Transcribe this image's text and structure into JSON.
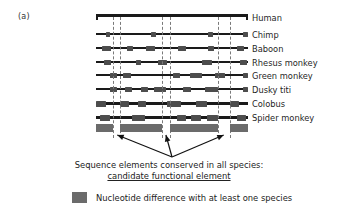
{
  "figure": {
    "panel_label": "(a)",
    "caption_line1": "Sequence elements conserved in all species:",
    "caption_line2": "candidate functional element",
    "colors": {
      "backbone": "#1a1a1a",
      "difference_mark": "#4d4d4d",
      "summary_bar": "#6b6b6b",
      "dashed_guide": "#7a7a7a",
      "background": "#ffffff"
    }
  },
  "legend": {
    "swatch_name": "nucleotide-difference-swatch",
    "text": "Nucleotide difference with at least one species"
  },
  "conserved_regions": [
    {
      "start_pct": 11.2,
      "end_pct": 15.8
    },
    {
      "start_pct": 43.4,
      "end_pct": 48.7
    },
    {
      "start_pct": 80.3,
      "end_pct": 88.2
    }
  ],
  "guide_lines_pct": [
    11.2,
    15.8,
    43.4,
    48.7,
    80.3,
    88.2
  ],
  "summary_segments_pct": [
    {
      "start": 0.0,
      "end": 11.2
    },
    {
      "start": 15.8,
      "end": 43.4
    },
    {
      "start": 48.7,
      "end": 80.3
    },
    {
      "start": 88.2,
      "end": 100.0
    }
  ],
  "arrows": [
    {
      "from_pct": 50.0,
      "to_pct": 14.0,
      "name": "arrow-to-region-1"
    },
    {
      "from_pct": 50.0,
      "to_pct": 46.0,
      "name": "arrow-to-region-2"
    },
    {
      "from_pct": 50.0,
      "to_pct": 84.0,
      "name": "arrow-to-region-3"
    }
  ],
  "tracks": [
    {
      "species": "Human",
      "y": 0,
      "backbone_height": 3,
      "is_reference": true,
      "marks": []
    },
    {
      "species": "Chimp",
      "y": 16,
      "backbone_height": 2,
      "is_reference": false,
      "marks": [
        {
          "x_pct": 6.5,
          "w_pct": 3.0
        },
        {
          "x_pct": 36.5,
          "w_pct": 3.0
        },
        {
          "x_pct": 74.0,
          "w_pct": 3.0
        },
        {
          "x_pct": 96.5,
          "w_pct": 3.5
        }
      ]
    },
    {
      "species": "Baboon",
      "y": 30,
      "backbone_height": 2,
      "is_reference": false,
      "marks": [
        {
          "x_pct": 4.0,
          "w_pct": 6.0
        },
        {
          "x_pct": 20.5,
          "w_pct": 4.0
        },
        {
          "x_pct": 33.0,
          "w_pct": 6.0
        },
        {
          "x_pct": 54.0,
          "w_pct": 5.0
        },
        {
          "x_pct": 73.5,
          "w_pct": 4.0
        },
        {
          "x_pct": 92.5,
          "w_pct": 5.0
        }
      ]
    },
    {
      "species": "Rhesus monkey",
      "y": 44,
      "backbone_height": 2,
      "is_reference": false,
      "marks": [
        {
          "x_pct": 5.5,
          "w_pct": 4.5
        },
        {
          "x_pct": 26.0,
          "w_pct": 3.5
        },
        {
          "x_pct": 40.5,
          "w_pct": 6.0
        },
        {
          "x_pct": 70.0,
          "w_pct": 6.5
        },
        {
          "x_pct": 95.0,
          "w_pct": 4.5
        }
      ]
    },
    {
      "species": "Green monkey",
      "y": 57,
      "backbone_height": 2,
      "is_reference": false,
      "marks": [
        {
          "x_pct": 9.0,
          "w_pct": 5.0
        },
        {
          "x_pct": 17.5,
          "w_pct": 5.5
        },
        {
          "x_pct": 50.5,
          "w_pct": 5.0
        },
        {
          "x_pct": 62.0,
          "w_pct": 7.5
        },
        {
          "x_pct": 78.5,
          "w_pct": 6.5
        },
        {
          "x_pct": 97.0,
          "w_pct": 3.0
        }
      ]
    },
    {
      "species": "Dusky titi",
      "y": 71,
      "backbone_height": 2,
      "is_reference": false,
      "marks": [
        {
          "x_pct": 9.5,
          "w_pct": 4.0
        },
        {
          "x_pct": 19.0,
          "w_pct": 4.5
        },
        {
          "x_pct": 29.5,
          "w_pct": 5.0
        },
        {
          "x_pct": 38.0,
          "w_pct": 8.0
        },
        {
          "x_pct": 57.5,
          "w_pct": 5.0
        },
        {
          "x_pct": 72.0,
          "w_pct": 8.0
        },
        {
          "x_pct": 97.0,
          "w_pct": 3.0
        }
      ]
    },
    {
      "species": "Colobus",
      "y": 85,
      "backbone_height": 3,
      "is_reference": false,
      "marks": [
        {
          "x_pct": 0.0,
          "w_pct": 6.5
        },
        {
          "x_pct": 16.0,
          "w_pct": 6.0
        },
        {
          "x_pct": 27.5,
          "w_pct": 5.5
        },
        {
          "x_pct": 47.0,
          "w_pct": 9.0
        },
        {
          "x_pct": 66.0,
          "w_pct": 7.0
        },
        {
          "x_pct": 88.0,
          "w_pct": 6.0
        }
      ]
    },
    {
      "species": "Spider monkey",
      "y": 99,
      "backbone_height": 3,
      "is_reference": false,
      "marks": [
        {
          "x_pct": 2.5,
          "w_pct": 7.0
        },
        {
          "x_pct": 23.5,
          "w_pct": 9.0
        },
        {
          "x_pct": 53.0,
          "w_pct": 6.0
        },
        {
          "x_pct": 62.5,
          "w_pct": 6.5
        },
        {
          "x_pct": 73.0,
          "w_pct": 7.0
        },
        {
          "x_pct": 93.0,
          "w_pct": 6.0
        }
      ]
    }
  ]
}
